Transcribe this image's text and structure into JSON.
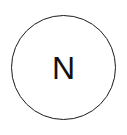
{
  "diagram": {
    "nodes": [
      {
        "id": "N",
        "label": "N",
        "shape": "circle",
        "stroke_color": "#1a1a1a",
        "fill_color": "#ffffff",
        "text_color": "#111111"
      }
    ]
  }
}
